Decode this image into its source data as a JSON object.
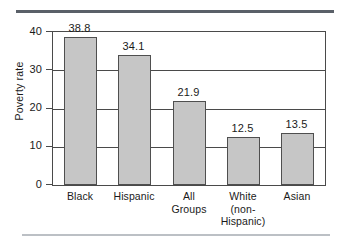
{
  "chart_data": {
    "type": "bar",
    "title": "",
    "xlabel": "",
    "ylabel": "Poverty rate",
    "ylim": [
      0,
      40
    ],
    "yticks": [
      0,
      10,
      20,
      30,
      40
    ],
    "ytick_labels": [
      "0",
      "10",
      "20",
      "30",
      "40"
    ],
    "grid": true,
    "legend": "none",
    "bar_color": "#c6c6c6",
    "bar_edge_color": "#4f4f4f",
    "categories": [
      "Black",
      "Hispanic",
      "All\nGroups",
      "White\n(non-\nHispanic)",
      "Asian"
    ],
    "values": [
      38.8,
      34.1,
      21.9,
      12.5,
      13.5
    ],
    "value_labels": [
      "38.8",
      "34.1",
      "21.9",
      "12.5",
      "13.5"
    ]
  },
  "decor": {
    "top_rule_color": "#5a6068",
    "bottom_rule_color": "#bcc0c5"
  }
}
